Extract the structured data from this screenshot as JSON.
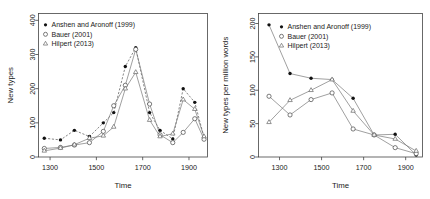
{
  "figure": {
    "panels": [
      "left",
      "right"
    ],
    "background": "#ffffff",
    "foreground": "#111111"
  },
  "legend": {
    "series_labels": [
      "Anshen and Aronoff (1999)",
      "Bauer (2001)",
      "Hilpert (2013)"
    ],
    "markers": [
      "filled-circle",
      "open-circle",
      "open-triangle"
    ],
    "position": "top-left-inside"
  },
  "chart_data": [
    {
      "panel": "left",
      "type": "line",
      "title": "",
      "xlabel": "Time",
      "ylabel": "New types",
      "xlim": [
        1250,
        1980
      ],
      "ylim": [
        0,
        420
      ],
      "xticks": [
        1300,
        1500,
        1700,
        1900
      ],
      "yticks": [
        0,
        100,
        200,
        300,
        400
      ],
      "xticklabels": [
        "1300",
        "1500",
        "1700",
        "1900"
      ],
      "yticklabels": [
        "0",
        "100",
        "200",
        "300",
        "400"
      ],
      "grid": false,
      "legend": "inside top-left",
      "x": [
        1275,
        1345,
        1405,
        1470,
        1530,
        1575,
        1625,
        1670,
        1730,
        1775,
        1830,
        1875,
        1925,
        1965
      ],
      "series": [
        {
          "name": "Anshen and Aronoff (1999)",
          "marker": "filled-circle",
          "linestyle": "dashed",
          "values": [
            55,
            50,
            78,
            60,
            100,
            130,
            265,
            320,
            130,
            78,
            53,
            200,
            160,
            57,
            5
          ]
        },
        {
          "name": "Bauer (2001)",
          "marker": "open-circle",
          "linestyle": "solid",
          "values": [
            25,
            28,
            35,
            42,
            75,
            150,
            210,
            315,
            155,
            65,
            42,
            72,
            112,
            52,
            57
          ]
        },
        {
          "name": "Hilpert (2013)",
          "marker": "open-triangle",
          "linestyle": "solid",
          "values": [
            18,
            26,
            36,
            55,
            62,
            88,
            200,
            248,
            108,
            60,
            68,
            168,
            140,
            60,
            48
          ]
        }
      ]
    },
    {
      "panel": "right",
      "type": "line",
      "title": "",
      "xlabel": "Time",
      "ylabel": "New types per million words",
      "xlim": [
        1200,
        1980
      ],
      "ylim": [
        0,
        215
      ],
      "xticks": [
        1300,
        1500,
        1700,
        1900
      ],
      "yticks": [
        0,
        50,
        100,
        150,
        200
      ],
      "xticklabels": [
        "1300",
        "1500",
        "1700",
        "1900"
      ],
      "yticklabels": [
        "0",
        "50",
        "100",
        "150",
        "200"
      ],
      "grid": false,
      "legend": "inside top-right",
      "x": [
        1250,
        1350,
        1450,
        1550,
        1650,
        1750,
        1850,
        1950
      ],
      "series": [
        {
          "name": "Anshen and Aronoff (1999)",
          "marker": "filled-circle",
          "linestyle": "solid",
          "values": [
            198,
            125,
            118,
            116,
            88,
            33,
            34,
            3
          ]
        },
        {
          "name": "Bauer (2001)",
          "marker": "open-circle",
          "linestyle": "solid",
          "values": [
            91,
            63,
            86,
            96,
            42,
            33,
            14,
            5
          ]
        },
        {
          "name": "Hilpert (2013)",
          "marker": "open-triangle",
          "linestyle": "solid",
          "values": [
            52,
            85,
            100,
            116,
            69,
            33,
            27,
            9
          ]
        }
      ]
    }
  ]
}
